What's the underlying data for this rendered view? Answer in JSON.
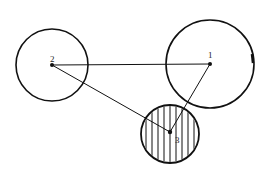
{
  "diagram": {
    "type": "node-link",
    "nodes": [
      {
        "id": "1",
        "label": "1",
        "cx": 210,
        "cy": 64,
        "r": 44,
        "hatched": false
      },
      {
        "id": "2",
        "label": "2",
        "cx": 52,
        "cy": 65,
        "r": 36,
        "hatched": false
      },
      {
        "id": "3",
        "label": "3",
        "cx": 170,
        "cy": 134,
        "r": 29,
        "hatched": true
      }
    ],
    "edges": [
      {
        "from": "2",
        "to": "1"
      },
      {
        "from": "2",
        "to": "3"
      },
      {
        "from": "1",
        "to": "3"
      }
    ],
    "colors": {
      "stroke": "#111111",
      "background": "#ffffff"
    }
  }
}
